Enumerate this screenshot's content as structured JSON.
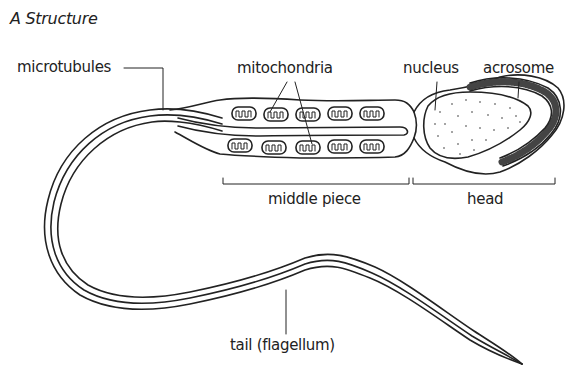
{
  "figure": {
    "title": "A  Structure",
    "colors": {
      "ink": "#222222",
      "background": "#ffffff"
    }
  },
  "labels": {
    "microtubules": "microtubules",
    "mitochondria": "mitochondria",
    "nucleus": "nucleus",
    "acrosome": "acrosome",
    "middle_piece": "middle piece",
    "head": "head",
    "tail": "tail (flagellum)"
  },
  "regions": [
    {
      "name": "head",
      "bracket_x": [
        413,
        555
      ]
    },
    {
      "name": "middle piece",
      "bracket_x": [
        223,
        409
      ]
    },
    {
      "name": "tail (flagellum)"
    }
  ]
}
